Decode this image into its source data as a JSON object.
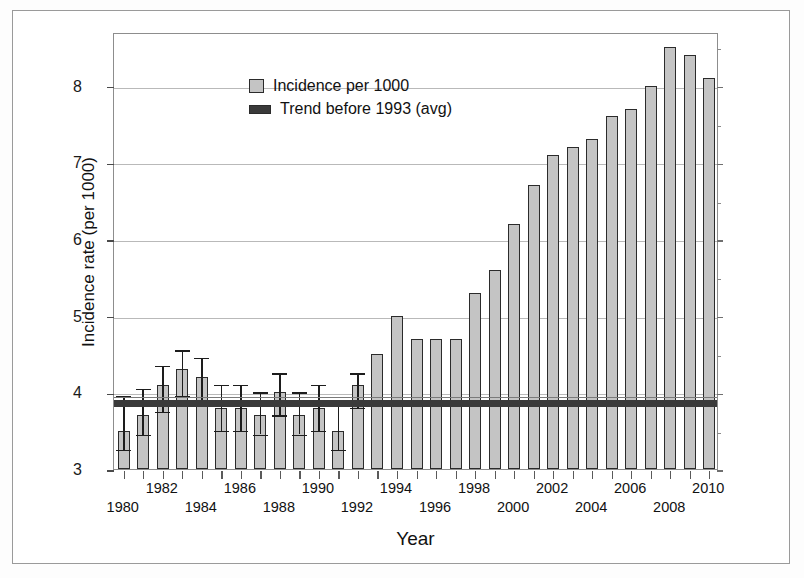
{
  "figure": {
    "yaxis_title": "Incidence rate (per 1000)",
    "xaxis_title": "Year"
  },
  "legend": {
    "items": [
      {
        "label": "Incidence per 1000",
        "swatch": "bar-swatch",
        "color": "#c4c4c4"
      },
      {
        "label": "Trend before 1993 (avg)",
        "swatch": "trend-swatch",
        "color": "#3a3a3a"
      }
    ]
  },
  "chart_data": {
    "type": "bar",
    "title": "",
    "xlabel": "Year",
    "ylabel": "Incidence rate (per 1000)",
    "ylim": [
      3,
      8.7
    ],
    "yticks": [
      3,
      4,
      5,
      6,
      7,
      8
    ],
    "ytick_labels": [
      "3",
      "4",
      "5",
      "6",
      "7",
      "8"
    ],
    "grid": true,
    "legend_position": "top-left",
    "categories": [
      "1980",
      "1981",
      "1982",
      "1983",
      "1984",
      "1985",
      "1986",
      "1987",
      "1988",
      "1989",
      "1990",
      "1991",
      "1992",
      "1993",
      "1994",
      "1995",
      "1996",
      "1997",
      "1998",
      "1999",
      "2000",
      "2001",
      "2002",
      "2003",
      "2004",
      "2005",
      "2006",
      "2007",
      "2008",
      "2009",
      "2010"
    ],
    "xtick_labels_shown": [
      "1980",
      "1982",
      "1984",
      "1986",
      "1988",
      "1990",
      "1992",
      "1994",
      "1996",
      "1998",
      "2000",
      "2002",
      "2004",
      "2006",
      "2008",
      "2010"
    ],
    "series": [
      {
        "name": "Incidence per 1000",
        "values": [
          3.5,
          3.7,
          4.1,
          4.3,
          4.2,
          3.8,
          3.8,
          3.7,
          4.0,
          3.7,
          3.8,
          3.5,
          4.1,
          4.5,
          5.0,
          4.7,
          4.7,
          4.7,
          5.3,
          5.6,
          6.2,
          6.7,
          7.1,
          7.2,
          7.3,
          7.6,
          7.7,
          8.0,
          8.5,
          8.4,
          8.1
        ]
      }
    ],
    "error_bars": {
      "applies_to_years": [
        "1980",
        "1981",
        "1982",
        "1983",
        "1984",
        "1985",
        "1986",
        "1987",
        "1988",
        "1989",
        "1990",
        "1991",
        "1992"
      ],
      "low": [
        3.25,
        3.45,
        3.75,
        3.95,
        3.9,
        3.5,
        3.5,
        3.45,
        3.7,
        3.45,
        3.5,
        3.25,
        3.8
      ],
      "high": [
        3.95,
        4.05,
        4.35,
        4.55,
        4.45,
        4.1,
        4.1,
        4.0,
        4.25,
        4.0,
        4.1,
        3.9,
        4.25
      ]
    },
    "annotations": [
      {
        "name": "trend-before-1993-average",
        "label": "Trend before 1993 (avg)",
        "type": "horizontal-band",
        "value": 3.88,
        "band_half_width": 0.05,
        "color": "#3a3a3a",
        "spans_full_width": true
      },
      {
        "name": "reference-line-thin",
        "type": "horizontal-line",
        "value": 3.97,
        "color": "#7a7a7a"
      }
    ]
  }
}
